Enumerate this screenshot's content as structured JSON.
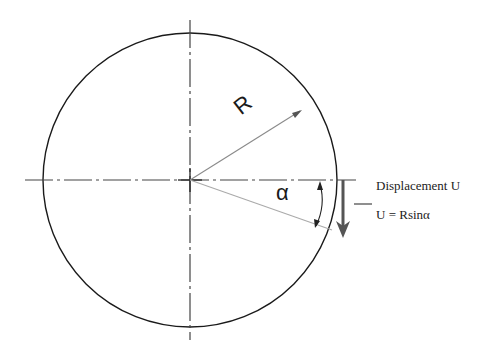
{
  "diagram": {
    "type": "circle-displacement",
    "labels": {
      "radius": "R",
      "angle": "α",
      "displacement": "Displacement U",
      "equation": "U = Rsinα"
    },
    "geometry": {
      "center": [
        190,
        180
      ],
      "radius": 147
    },
    "colors": {
      "stroke": "#1a1a1a",
      "centerline": "#444444",
      "radius_line": "#8a8a8a",
      "arrow": "#555555"
    }
  }
}
